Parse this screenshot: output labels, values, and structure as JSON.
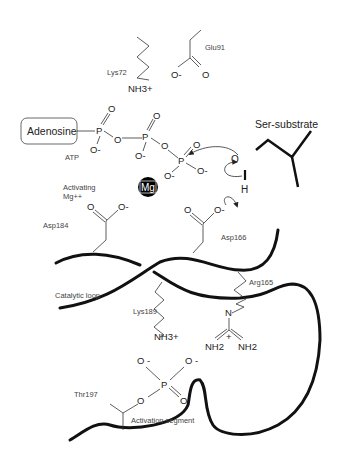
{
  "diagram": {
    "type": "kinase catalytic mechanism schematic",
    "residues": {
      "lys72": {
        "label": "Lys72",
        "group": "NH3+"
      },
      "glu91": {
        "label": "Glu91",
        "o_minus": "O-",
        "o": "O"
      },
      "asp184": {
        "label": "Asp184"
      },
      "asp166": {
        "label": "Asp166"
      },
      "arg165": {
        "label": "Arg165",
        "n": "N",
        "nh2_left": "NH2",
        "nh2_right": "NH2",
        "charge": "+"
      },
      "lys189": {
        "label": "Lys189",
        "group": "NH3+"
      },
      "thr197": {
        "label": "Thr197"
      }
    },
    "atp": {
      "adenosine": "Adenosine",
      "label": "ATP",
      "p": "P",
      "o": "O",
      "o_minus": "O-"
    },
    "mg": {
      "symbol": "Mg",
      "label_line1": "Activating",
      "label_line2": "Mg++"
    },
    "substrate": {
      "label": "Ser-substrate",
      "o": "O",
      "h": "H"
    },
    "regions": {
      "catalytic_loop": "Catalytic loop",
      "activation_segment": "Activation segment"
    },
    "phosphate": {
      "p": "P",
      "o": "O",
      "o_minus": "O -"
    },
    "colors": {
      "backbone": "#111111",
      "text": "#444444",
      "mg_fill": "#000000"
    }
  }
}
